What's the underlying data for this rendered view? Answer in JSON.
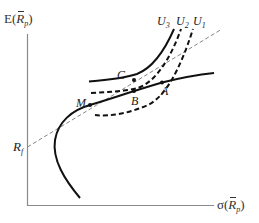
{
  "figure": {
    "type": "mean-variance portfolio diagram",
    "y_axis": {
      "label_prefix": "E(",
      "label_var": "R",
      "label_sub": "p",
      "label_suffix": ")"
    },
    "x_axis": {
      "label_prefix": "σ(",
      "label_var": "R",
      "label_sub": "p",
      "label_suffix": ")"
    },
    "risk_free": {
      "label_var": "R",
      "label_sub": "f"
    },
    "points": [
      {
        "id": "M",
        "label": "M"
      },
      {
        "id": "B",
        "label": "B"
      },
      {
        "id": "C",
        "label": "C"
      },
      {
        "id": "A",
        "label": "A"
      }
    ],
    "indifference_curves": [
      {
        "id": "U3",
        "label_var": "U",
        "label_sub": "3",
        "style": "solid"
      },
      {
        "id": "U2",
        "label_var": "U",
        "label_sub": "2",
        "style": "dashed"
      },
      {
        "id": "U1",
        "label_var": "U",
        "label_sub": "1",
        "style": "dashed"
      }
    ],
    "colors": {
      "axis": "#8a8a8a",
      "curve": "#111111",
      "tangent_line": "#777777",
      "label": "#222222"
    }
  }
}
